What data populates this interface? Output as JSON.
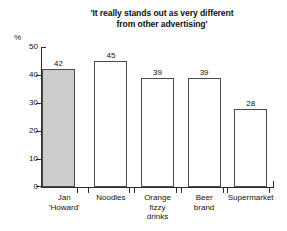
{
  "chart_data": {
    "type": "bar",
    "title": "'It really stands out as very different\nfrom other advertising'",
    "xlabel": "",
    "ylabel": "%",
    "ylim": [
      0,
      50
    ],
    "yticks": [
      0,
      10,
      20,
      30,
      40,
      50
    ],
    "ytick_labels": [
      "0",
      "10",
      "20",
      "30",
      "40",
      "50"
    ],
    "grid": false,
    "legend": "none",
    "categories": [
      "Jan\n'Howard'",
      "Noodles",
      "Orange\nfizzy\ndrinks",
      "Beer\nbrand",
      "Supermarket"
    ],
    "values": [
      42,
      45,
      39,
      39,
      28
    ],
    "value_labels": [
      "42",
      "45",
      "39",
      "39",
      "28"
    ],
    "highlight_index": 0,
    "colors": {
      "highlight_fill": "#cccccc",
      "bar_fill": "#ffffff",
      "bar_stroke": "#4a4a4a",
      "axis": "#2b2b2b",
      "text": "#111111",
      "background": "#ffffff"
    }
  }
}
